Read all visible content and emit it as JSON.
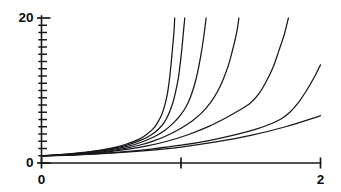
{
  "chart_data": {
    "type": "line",
    "title": "",
    "subtitle": "",
    "xlabel": "",
    "ylabel": "",
    "xlim": [
      0,
      2
    ],
    "ylim": [
      0,
      20
    ],
    "grid": false,
    "legend": "none",
    "x_ticks": [
      {
        "value": 0,
        "label": "0",
        "major": true
      },
      {
        "value": 1,
        "label": "",
        "major": true
      },
      {
        "value": 2,
        "label": "2",
        "major": true
      }
    ],
    "y_ticks": [
      {
        "value": 0,
        "label": "0",
        "major": true
      },
      {
        "value": 1,
        "label": "",
        "major": false
      },
      {
        "value": 2,
        "label": "",
        "major": false
      },
      {
        "value": 3,
        "label": "",
        "major": false
      },
      {
        "value": 4,
        "label": "",
        "major": false
      },
      {
        "value": 5,
        "label": "",
        "major": false
      },
      {
        "value": 6,
        "label": "",
        "major": false
      },
      {
        "value": 7,
        "label": "",
        "major": false
      },
      {
        "value": 8,
        "label": "",
        "major": false
      },
      {
        "value": 9,
        "label": "",
        "major": false
      },
      {
        "value": 10,
        "label": "",
        "major": false
      },
      {
        "value": 11,
        "label": "",
        "major": false
      },
      {
        "value": 12,
        "label": "",
        "major": false
      },
      {
        "value": 13,
        "label": "",
        "major": false
      },
      {
        "value": 14,
        "label": "",
        "major": false
      },
      {
        "value": 15,
        "label": "",
        "major": false
      },
      {
        "value": 16,
        "label": "",
        "major": false
      },
      {
        "value": 17,
        "label": "",
        "major": false
      },
      {
        "value": 18,
        "label": "",
        "major": false
      },
      {
        "value": 19,
        "label": "",
        "major": false
      },
      {
        "value": 20,
        "label": "20",
        "major": true
      }
    ],
    "axis_color": "#1a1a1a",
    "curve_color": "#17171c",
    "series": [
      {
        "name": "curve-1",
        "points": [
          [
            0.0,
            1.0
          ],
          [
            0.1,
            1.1
          ],
          [
            0.2,
            1.25
          ],
          [
            0.3,
            1.45
          ],
          [
            0.4,
            1.7
          ],
          [
            0.5,
            2.05
          ],
          [
            0.6,
            2.55
          ],
          [
            0.7,
            3.3
          ],
          [
            0.75,
            3.9
          ],
          [
            0.8,
            4.7
          ],
          [
            0.83,
            5.5
          ],
          [
            0.86,
            6.6
          ],
          [
            0.88,
            7.7
          ],
          [
            0.9,
            9.3
          ],
          [
            0.91,
            10.5
          ],
          [
            0.92,
            12.0
          ],
          [
            0.93,
            13.9
          ],
          [
            0.94,
            16.0
          ],
          [
            0.95,
            18.2
          ],
          [
            0.955,
            20.0
          ]
        ]
      },
      {
        "name": "curve-2",
        "points": [
          [
            0.0,
            1.0
          ],
          [
            0.1,
            1.08
          ],
          [
            0.2,
            1.22
          ],
          [
            0.3,
            1.4
          ],
          [
            0.4,
            1.64
          ],
          [
            0.5,
            1.96
          ],
          [
            0.6,
            2.4
          ],
          [
            0.7,
            3.05
          ],
          [
            0.78,
            3.8
          ],
          [
            0.84,
            4.7
          ],
          [
            0.88,
            5.6
          ],
          [
            0.91,
            6.7
          ],
          [
            0.94,
            8.2
          ],
          [
            0.96,
            9.7
          ],
          [
            0.98,
            11.6
          ],
          [
            0.99,
            13.0
          ],
          [
            1.0,
            14.6
          ],
          [
            1.01,
            16.5
          ],
          [
            1.02,
            18.6
          ],
          [
            1.027,
            20.0
          ]
        ]
      },
      {
        "name": "curve-3",
        "points": [
          [
            0.0,
            1.0
          ],
          [
            0.1,
            1.07
          ],
          [
            0.2,
            1.19
          ],
          [
            0.3,
            1.35
          ],
          [
            0.4,
            1.56
          ],
          [
            0.5,
            1.84
          ],
          [
            0.6,
            2.22
          ],
          [
            0.7,
            2.76
          ],
          [
            0.8,
            3.55
          ],
          [
            0.88,
            4.45
          ],
          [
            0.95,
            5.6
          ],
          [
            1.0,
            6.7
          ],
          [
            1.04,
            7.9
          ],
          [
            1.07,
            9.2
          ],
          [
            1.1,
            11.0
          ],
          [
            1.12,
            12.6
          ],
          [
            1.14,
            14.6
          ],
          [
            1.16,
            17.0
          ],
          [
            1.175,
            19.2
          ],
          [
            1.18,
            20.0
          ]
        ]
      },
      {
        "name": "curve-4",
        "points": [
          [
            0.0,
            1.0
          ],
          [
            0.1,
            1.06
          ],
          [
            0.2,
            1.16
          ],
          [
            0.3,
            1.3
          ],
          [
            0.4,
            1.48
          ],
          [
            0.5,
            1.72
          ],
          [
            0.6,
            2.03
          ],
          [
            0.7,
            2.45
          ],
          [
            0.8,
            3.02
          ],
          [
            0.9,
            3.8
          ],
          [
            1.0,
            4.8
          ],
          [
            1.08,
            5.8
          ],
          [
            1.15,
            6.95
          ],
          [
            1.21,
            8.3
          ],
          [
            1.26,
            9.8
          ],
          [
            1.3,
            11.4
          ],
          [
            1.34,
            13.5
          ],
          [
            1.37,
            15.6
          ],
          [
            1.4,
            18.1
          ],
          [
            1.415,
            20.0
          ]
        ]
      },
      {
        "name": "curve-5",
        "points": [
          [
            0.0,
            1.0
          ],
          [
            0.15,
            1.08
          ],
          [
            0.3,
            1.24
          ],
          [
            0.45,
            1.48
          ],
          [
            0.6,
            1.83
          ],
          [
            0.75,
            2.32
          ],
          [
            0.9,
            3.0
          ],
          [
            1.05,
            3.9
          ],
          [
            1.2,
            5.05
          ],
          [
            1.32,
            6.2
          ],
          [
            1.42,
            7.3
          ],
          [
            1.5,
            8.3
          ],
          [
            1.56,
            9.6
          ],
          [
            1.61,
            11.2
          ],
          [
            1.66,
            13.2
          ],
          [
            1.7,
            15.4
          ],
          [
            1.74,
            17.7
          ],
          [
            1.77,
            20.0
          ]
        ]
      },
      {
        "name": "curve-6",
        "points": [
          [
            0.0,
            1.0
          ],
          [
            0.2,
            1.1
          ],
          [
            0.4,
            1.3
          ],
          [
            0.6,
            1.58
          ],
          [
            0.8,
            1.96
          ],
          [
            1.0,
            2.45
          ],
          [
            1.2,
            3.1
          ],
          [
            1.4,
            3.95
          ],
          [
            1.55,
            4.75
          ],
          [
            1.65,
            5.45
          ],
          [
            1.72,
            6.1
          ],
          [
            1.78,
            7.0
          ],
          [
            1.84,
            8.3
          ],
          [
            1.9,
            10.0
          ],
          [
            1.96,
            12.0
          ],
          [
            2.02,
            14.3
          ],
          [
            2.08,
            16.8
          ],
          [
            2.13,
            19.2
          ]
        ]
      },
      {
        "name": "curve-7",
        "points": [
          [
            0.0,
            1.0
          ],
          [
            0.25,
            1.12
          ],
          [
            0.5,
            1.35
          ],
          [
            0.75,
            1.7
          ],
          [
            1.0,
            2.2
          ],
          [
            1.25,
            2.9
          ],
          [
            1.5,
            3.8
          ],
          [
            1.75,
            5.0
          ],
          [
            1.95,
            6.2
          ],
          [
            2.1,
            7.2
          ],
          [
            2.22,
            8.1
          ],
          [
            2.32,
            9.0
          ],
          [
            2.42,
            10.3
          ],
          [
            2.52,
            12.0
          ],
          [
            2.62,
            14.2
          ],
          [
            2.7,
            16.5
          ],
          [
            2.78,
            19.0
          ]
        ]
      }
    ]
  }
}
